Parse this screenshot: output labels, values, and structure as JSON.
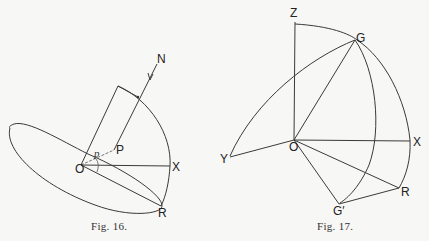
{
  "figures": [
    {
      "id": "fig16",
      "caption": "Fig. 16.",
      "labels": {
        "N": "N",
        "P": "P",
        "p": "p",
        "O": "O",
        "X": "X",
        "R": "R"
      }
    },
    {
      "id": "fig17",
      "caption": "Fig. 17.",
      "labels": {
        "Z": "Z",
        "G": "G",
        "O": "O",
        "X": "X",
        "Y": "Y",
        "R": "R",
        "G_prime": "G′"
      }
    }
  ],
  "colors": {
    "background": "#f7f7f5",
    "line": "#3a3a3a",
    "text": "#222222"
  }
}
